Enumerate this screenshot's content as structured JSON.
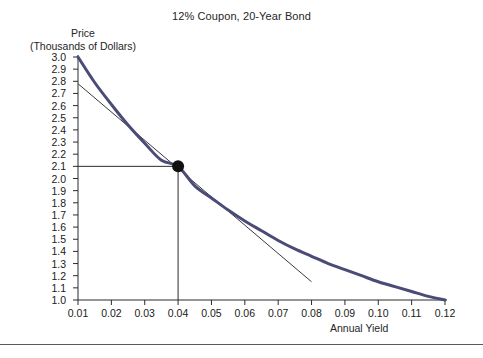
{
  "chart_data": {
    "type": "line",
    "title": "12% Coupon, 20-Year Bond",
    "xlabel": "Annual Yield",
    "ylabel": "Price\n(Thousands of Dollars)",
    "ylabel_line1": "Price",
    "ylabel_line2": "(Thousands of Dollars)",
    "xlim": [
      0.01,
      0.12
    ],
    "ylim": [
      1.0,
      3.0
    ],
    "grid": false,
    "legend": "none",
    "xticks": [
      "0.01",
      "0.02",
      "0.03",
      "0.04",
      "0.05",
      "0.06",
      "0.07",
      "0.08",
      "0.09",
      "0.10",
      "0.11",
      "0.12"
    ],
    "xtick_values": [
      0.01,
      0.02,
      0.03,
      0.04,
      0.05,
      0.06,
      0.07,
      0.08,
      0.09,
      0.1,
      0.11,
      0.12
    ],
    "yticks": [
      "3.0",
      "2.9",
      "2.8",
      "2.7",
      "2.6",
      "2.5",
      "2.4",
      "2.3",
      "2.2",
      "2.1",
      "2.0",
      "1.9",
      "1.8",
      "1.7",
      "1.6",
      "1.5",
      "1.4",
      "1.3",
      "1.2",
      "1.1",
      "1.0"
    ],
    "ytick_values": [
      3.0,
      2.9,
      2.8,
      2.7,
      2.6,
      2.5,
      2.4,
      2.3,
      2.2,
      2.1,
      2.0,
      1.9,
      1.8,
      1.7,
      1.6,
      1.5,
      1.4,
      1.3,
      1.2,
      1.1,
      1.0
    ],
    "series": [
      {
        "name": "Price-yield curve",
        "color": "#4b4b77",
        "width": 3,
        "x": [
          0.01,
          0.015,
          0.02,
          0.025,
          0.03,
          0.035,
          0.04,
          0.045,
          0.05,
          0.055,
          0.06,
          0.065,
          0.07,
          0.075,
          0.08,
          0.085,
          0.09,
          0.095,
          0.1,
          0.105,
          0.11,
          0.115,
          0.12
        ],
        "values": [
          3.0,
          2.79,
          2.61,
          2.44,
          2.29,
          2.15,
          2.1,
          1.94,
          1.84,
          1.74,
          1.65,
          1.57,
          1.49,
          1.42,
          1.36,
          1.3,
          1.25,
          1.2,
          1.15,
          1.11,
          1.07,
          1.03,
          1.0
        ]
      },
      {
        "name": "Tangent line at 0.04",
        "color": "#3a3a3a",
        "width": 1,
        "x": [
          0.01,
          0.08
        ],
        "values": [
          2.78,
          1.15
        ]
      }
    ],
    "annotations": [
      {
        "name": "tangency-point",
        "x": 0.04,
        "y": 2.1,
        "marker": "filled-circle",
        "color": "#101010"
      },
      {
        "name": "price-reference-line",
        "y": 2.1,
        "from_x": 0.01,
        "to_x": 0.04
      },
      {
        "name": "yield-reference-line",
        "x": 0.04,
        "from_y": 1.0,
        "to_y": 2.1
      }
    ]
  }
}
